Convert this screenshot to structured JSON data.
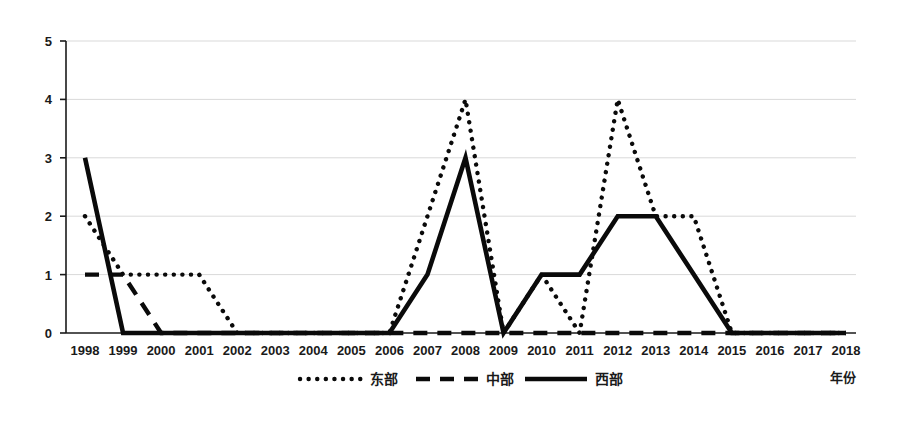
{
  "chart_data": {
    "type": "line",
    "title": "",
    "xlabel": "年份",
    "ylabel": "",
    "grid": true,
    "legend_position": "bottom",
    "xlim": [
      1998,
      2018
    ],
    "ylim": [
      0,
      5
    ],
    "yticks": [
      "0",
      "1",
      "2",
      "3",
      "4",
      "5"
    ],
    "categories": [
      "1998",
      "1999",
      "2000",
      "2001",
      "2002",
      "2003",
      "2004",
      "2005",
      "2006",
      "2007",
      "2008",
      "2009",
      "2010",
      "2011",
      "2012",
      "2013",
      "2014",
      "2015",
      "2016",
      "2017",
      "2018"
    ],
    "series": [
      {
        "name": "东部",
        "style": "dotted",
        "values": [
          2,
          1,
          1,
          1,
          0,
          0,
          0,
          0,
          0,
          2,
          4,
          0,
          1,
          0,
          4,
          2,
          2,
          0,
          0,
          0,
          0
        ]
      },
      {
        "name": "中部",
        "style": "dashed",
        "values": [
          1,
          1,
          0,
          0,
          0,
          0,
          0,
          0,
          0,
          0,
          0,
          0,
          0,
          0,
          0,
          0,
          0,
          0,
          0,
          0,
          0
        ]
      },
      {
        "name": "西部",
        "style": "solid",
        "values": [
          3,
          0,
          0,
          0,
          0,
          0,
          0,
          0,
          0,
          1,
          3,
          0,
          1,
          1,
          2,
          2,
          1,
          0,
          0,
          0,
          0
        ]
      }
    ]
  },
  "axis": {
    "y_labels": [
      "5",
      "4",
      "3",
      "2",
      "1",
      "0"
    ],
    "x_labels": [
      "1998",
      "1999",
      "2000",
      "2001",
      "2002",
      "2003",
      "2004",
      "2005",
      "2006",
      "2007",
      "2008",
      "2009",
      "2010",
      "2011",
      "2012",
      "2013",
      "2014",
      "2015",
      "2016",
      "2017",
      "2018"
    ],
    "x_axis_title": "年份"
  },
  "legend": {
    "items": [
      {
        "label": "东部",
        "style": "dotted"
      },
      {
        "label": "中部",
        "style": "dashed"
      },
      {
        "label": "西部",
        "style": "solid"
      }
    ]
  },
  "colors": {
    "line": "#0a0a0a",
    "grid": "#d9d9d9",
    "axis": "#1a1a1a",
    "background": "#ffffff"
  }
}
